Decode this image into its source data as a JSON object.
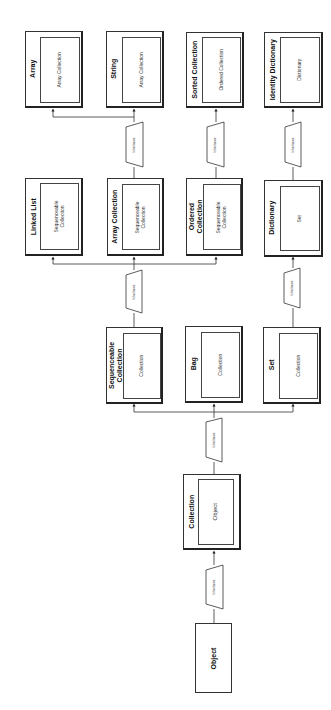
{
  "diagram": {
    "title": "",
    "orientation": "rotated-90-ccw",
    "edge_label": "Inheritance",
    "colors": {
      "stroke": "#333333",
      "background": "#ffffff",
      "text": "#111111"
    }
  },
  "nodes": {
    "object": {
      "title": "Object"
    },
    "collection": {
      "title": "Collection",
      "parent": "Object"
    },
    "sequenceable": {
      "title": "Sequenceable\nCollection",
      "parent": "Collection"
    },
    "bag": {
      "title": "Bag",
      "parent": "Collection"
    },
    "set": {
      "title": "Set",
      "parent": "Collection"
    },
    "linked_list": {
      "title": "Linked List",
      "parent": "Sequenceable\nCollection"
    },
    "array_collection": {
      "title": "Array Collection",
      "parent": "Sequenceable\nCollection"
    },
    "ordered_collection": {
      "title": "Ordered\nCollection",
      "parent": "Sequenceable\nCollection"
    },
    "dictionary": {
      "title": "Dictionary",
      "parent": "Set"
    },
    "array": {
      "title": "Array",
      "parent": "Array Collection"
    },
    "string": {
      "title": "String",
      "parent": "Array Collection"
    },
    "sorted_collection": {
      "title": "Sorted Collection",
      "parent": "Ordered Collection"
    },
    "identity_dictionary": {
      "title": "Identity Dictionary",
      "parent": "Dictionary"
    }
  },
  "edges": [
    {
      "from": "Object",
      "to": [
        "Collection"
      ],
      "label": "Inheritance"
    },
    {
      "from": "Collection",
      "to": [
        "Sequenceable Collection",
        "Bag",
        "Set"
      ],
      "label": "Inheritance"
    },
    {
      "from": "Sequenceable Collection",
      "to": [
        "Linked List",
        "Array Collection",
        "Ordered Collection"
      ],
      "label": "Inheritance"
    },
    {
      "from": "Set",
      "to": [
        "Dictionary"
      ],
      "label": "Inheritance"
    },
    {
      "from": "Array Collection",
      "to": [
        "Array",
        "String"
      ],
      "label": "Inheritance"
    },
    {
      "from": "Ordered Collection",
      "to": [
        "Sorted Collection"
      ],
      "label": "Inheritance"
    },
    {
      "from": "Dictionary",
      "to": [
        "Identity Dictionary"
      ],
      "label": "Inheritance"
    }
  ]
}
